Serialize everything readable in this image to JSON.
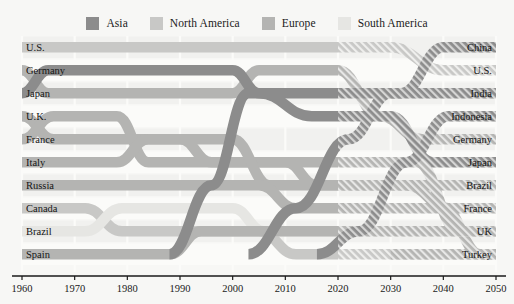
{
  "legend": {
    "items": [
      {
        "label": "Asia",
        "color": "#8c8c8c",
        "key": "asia"
      },
      {
        "label": "North America",
        "color": "#c8c8c6",
        "key": "north-america"
      },
      {
        "label": "Europe",
        "color": "#b4b4b2",
        "key": "europe"
      },
      {
        "label": "South America",
        "color": "#e6e6e3",
        "key": "south-america"
      }
    ]
  },
  "axis": {
    "ticks": [
      "1960",
      "1970",
      "1980",
      "1990",
      "2000",
      "2010",
      "2020",
      "2030",
      "2040",
      "2050"
    ],
    "min": 1960,
    "max": 2050,
    "step": 10,
    "axis_color": "#1a1a1a"
  },
  "labels": {
    "left": [
      "U.S.",
      "Germany",
      "Japan",
      "U.K.",
      "France",
      "Italy",
      "Russia",
      "Canada",
      "Brazil",
      "Spain"
    ],
    "right": [
      "China",
      "U.S.",
      "India",
      "Indonesia",
      "Germany",
      "Japan",
      "Brazil",
      "France",
      "UK",
      "Turkey"
    ]
  },
  "projection": {
    "starts_at": 2020,
    "hatched": true
  },
  "chart_data": {
    "type": "line",
    "title": "",
    "subtitle": "",
    "xlabel": "",
    "ylabel": "",
    "xlim": [
      1960,
      2050
    ],
    "ylim": [
      1,
      10
    ],
    "grid": true,
    "legend_position": "top-center",
    "y_axis_note": "rank 1 = top row, rank 10 = bottom row",
    "x": [
      1960,
      1970,
      1980,
      1990,
      2000,
      2010,
      2020,
      2030,
      2040,
      2050
    ],
    "series": [
      {
        "name": "U.S.",
        "region": "north-america",
        "color": "#c8c8c6",
        "values": [
          1,
          1,
          1,
          1,
          1,
          1,
          1,
          1,
          2,
          2
        ]
      },
      {
        "name": "Japan",
        "region": "asia",
        "color": "#8c8c8c",
        "values": [
          3,
          2,
          2,
          2,
          2,
          3,
          3,
          4,
          5,
          6
        ]
      },
      {
        "name": "Germany",
        "region": "europe",
        "color": "#b4b4b2",
        "values": [
          2,
          3,
          3,
          3,
          3,
          4,
          4,
          5,
          4,
          5
        ]
      },
      {
        "name": "U.K.",
        "region": "europe",
        "color": "#b4b4b2",
        "values": [
          4,
          4,
          5,
          5,
          5,
          6,
          6,
          7,
          8,
          9
        ]
      },
      {
        "name": "France",
        "region": "europe",
        "color": "#b4b4b2",
        "values": [
          5,
          5,
          4,
          4,
          6,
          7,
          7,
          8,
          7,
          8
        ]
      },
      {
        "name": "Italy",
        "region": "europe",
        "color": "#b4b4b2",
        "values": [
          6,
          6,
          6,
          6,
          7,
          8,
          8,
          9,
          10,
          11
        ]
      },
      {
        "name": "Russia",
        "region": "europe",
        "color": "#b4b4b2",
        "values": [
          7,
          7,
          7,
          7,
          8,
          9,
          9,
          10,
          11,
          12
        ]
      },
      {
        "name": "Canada",
        "region": "north-america",
        "color": "#c8c8c6",
        "values": [
          8,
          8,
          9,
          9,
          9,
          10,
          11,
          11,
          12,
          13
        ]
      },
      {
        "name": "Brazil",
        "region": "south-america",
        "color": "#e6e6e3",
        "values": [
          9,
          9,
          8,
          8,
          4,
          5,
          5,
          6,
          6,
          7
        ]
      },
      {
        "name": "Spain",
        "region": "europe",
        "color": "#b4b4b2",
        "values": [
          10,
          10,
          10,
          10,
          11,
          12,
          13,
          13,
          13,
          14
        ]
      },
      {
        "name": "China",
        "region": "asia",
        "color": "#8c8c8c",
        "values": [
          11,
          11,
          11,
          11,
          10,
          2,
          2,
          2,
          1,
          1
        ]
      },
      {
        "name": "India",
        "region": "asia",
        "color": "#8c8c8c",
        "values": [
          12,
          12,
          12,
          12,
          12,
          11,
          10,
          3,
          3,
          3
        ]
      },
      {
        "name": "Indonesia",
        "region": "asia",
        "color": "#8c8c8c",
        "values": [
          13,
          13,
          13,
          13,
          13,
          13,
          12,
          12,
          9,
          4
        ]
      },
      {
        "name": "Turkey",
        "region": "europe",
        "color": "#b4b4b2",
        "values": [
          14,
          14,
          14,
          14,
          14,
          14,
          14,
          14,
          14,
          10
        ]
      }
    ]
  },
  "ribbons": [
    {
      "name": "U.S.",
      "region": "north-america",
      "color": "#c8c8c6",
      "path": [
        [
          1960,
          1
        ],
        [
          2030,
          1
        ],
        [
          2040,
          2
        ],
        [
          2050,
          2
        ]
      ]
    },
    {
      "name": "Germany",
      "region": "europe",
      "color": "#b4b4b2",
      "path": [
        [
          1960,
          2
        ],
        [
          1965,
          3
        ],
        [
          2000,
          3
        ],
        [
          2005,
          2
        ],
        [
          2020,
          2
        ],
        [
          2028,
          4
        ],
        [
          2036,
          5
        ],
        [
          2050,
          5
        ]
      ]
    },
    {
      "name": "Japan",
      "region": "asia",
      "color": "#8c8c8c",
      "path": [
        [
          1960,
          3
        ],
        [
          1965,
          2
        ],
        [
          2000,
          2
        ],
        [
          2005,
          3
        ],
        [
          2015,
          4
        ],
        [
          2030,
          4
        ],
        [
          2038,
          6
        ],
        [
          2050,
          6
        ]
      ]
    },
    {
      "name": "U.K.",
      "region": "europe",
      "color": "#b4b4b2",
      "path": [
        [
          1960,
          4
        ],
        [
          1966,
          5
        ],
        [
          1990,
          5
        ],
        [
          1996,
          6
        ],
        [
          2035,
          6
        ],
        [
          2043,
          9
        ],
        [
          2050,
          9
        ]
      ]
    },
    {
      "name": "France",
      "region": "europe",
      "color": "#b4b4b2",
      "path": [
        [
          1960,
          5
        ],
        [
          1966,
          4
        ],
        [
          1978,
          4
        ],
        [
          1984,
          6
        ],
        [
          2010,
          6
        ],
        [
          2016,
          7
        ],
        [
          2033,
          7
        ],
        [
          2041,
          8
        ],
        [
          2050,
          8
        ]
      ]
    },
    {
      "name": "Italy",
      "region": "europe",
      "color": "#b4b4b2",
      "path": [
        [
          1960,
          6
        ],
        [
          1978,
          6
        ],
        [
          1984,
          5
        ],
        [
          2000,
          5
        ],
        [
          2007,
          7
        ],
        [
          2050,
          7
        ]
      ]
    },
    {
      "name": "Russia",
      "region": "europe",
      "color": "#b4b4b2",
      "path": [
        [
          1960,
          7
        ],
        [
          2005,
          7
        ],
        [
          2012,
          8
        ],
        [
          2040,
          8
        ],
        [
          2047,
          10
        ],
        [
          2050,
          10
        ]
      ]
    },
    {
      "name": "Canada",
      "region": "north-america",
      "color": "#c8c8c6",
      "path": [
        [
          1960,
          8
        ],
        [
          1972,
          8
        ],
        [
          1979,
          9
        ],
        [
          2005,
          9
        ],
        [
          2012,
          10
        ],
        [
          2050,
          10
        ]
      ]
    },
    {
      "name": "Brazil",
      "region": "south-america",
      "color": "#e6e6e3",
      "path": [
        [
          1960,
          9
        ],
        [
          1972,
          9
        ],
        [
          1979,
          8
        ],
        [
          2000,
          8
        ],
        [
          2006,
          9
        ],
        [
          2050,
          9
        ]
      ]
    },
    {
      "name": "Spain",
      "region": "europe",
      "color": "#b4b4b2",
      "path": [
        [
          1960,
          10
        ],
        [
          1988,
          10
        ],
        [
          1994,
          9
        ],
        [
          2050,
          9
        ]
      ]
    },
    {
      "name": "China",
      "region": "asia",
      "color": "#8c8c8c",
      "path": [
        [
          1988,
          10
        ],
        [
          1996,
          7
        ],
        [
          2003,
          3
        ],
        [
          2032,
          3
        ],
        [
          2040,
          1
        ],
        [
          2050,
          1
        ]
      ]
    },
    {
      "name": "India",
      "region": "asia",
      "color": "#8c8c8c",
      "path": [
        [
          2003,
          10
        ],
        [
          2012,
          8
        ],
        [
          2022,
          5
        ],
        [
          2030,
          3
        ],
        [
          2038,
          3
        ],
        [
          2045,
          3
        ],
        [
          2050,
          3
        ]
      ]
    },
    {
      "name": "Indonesia",
      "region": "asia",
      "color": "#8c8c8c",
      "path": [
        [
          2016,
          10
        ],
        [
          2024,
          9
        ],
        [
          2033,
          6
        ],
        [
          2041,
          4
        ],
        [
          2050,
          4
        ]
      ]
    },
    {
      "name": "Turkey",
      "region": "europe",
      "color": "#b4b4b2",
      "path": [
        [
          2030,
          10
        ],
        [
          2038,
          10
        ],
        [
          2046,
          10
        ],
        [
          2050,
          10
        ]
      ]
    }
  ]
}
